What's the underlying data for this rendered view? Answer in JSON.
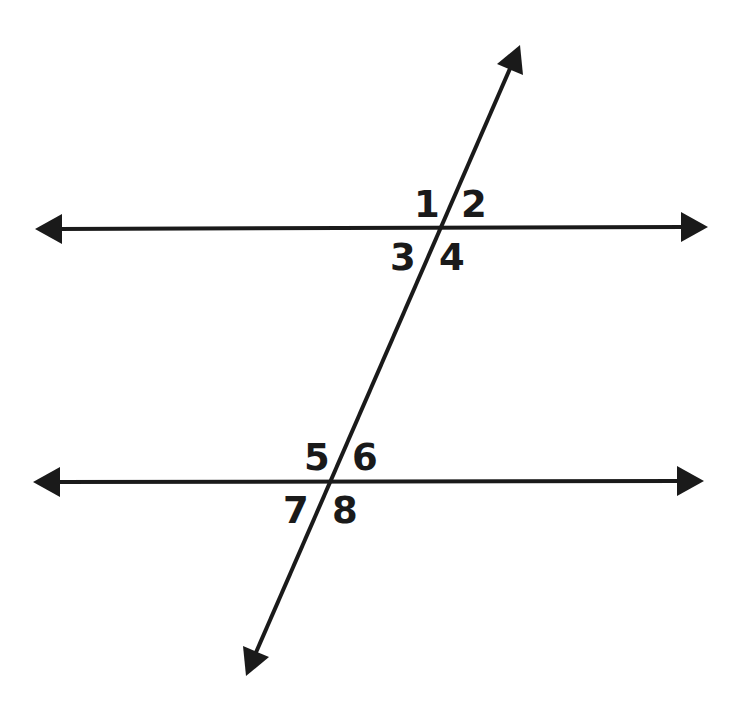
{
  "diagram": {
    "colors": {
      "background": "#ffffff",
      "stroke": "#1a1a1a"
    },
    "lines": {
      "upper_parallel": {
        "x1": 35,
        "y1": 229,
        "x2": 708,
        "y2": 227
      },
      "lower_parallel": {
        "x1": 33,
        "y1": 482,
        "x2": 704,
        "y2": 481
      },
      "transversal": {
        "x1": 520,
        "y1": 45,
        "x2": 246,
        "y2": 676
      }
    },
    "intersections": {
      "upper": {
        "x": 438,
        "y": 228
      },
      "lower": {
        "x": 329,
        "y": 482
      }
    },
    "angle_labels": [
      {
        "id": "1",
        "text": "1",
        "x": 414,
        "y": 217
      },
      {
        "id": "2",
        "text": "2",
        "x": 461,
        "y": 217
      },
      {
        "id": "3",
        "text": "3",
        "x": 390,
        "y": 270
      },
      {
        "id": "4",
        "text": "4",
        "x": 439,
        "y": 270
      },
      {
        "id": "5",
        "text": "5",
        "x": 304,
        "y": 470
      },
      {
        "id": "6",
        "text": "6",
        "x": 352,
        "y": 470
      },
      {
        "id": "7",
        "text": "7",
        "x": 283,
        "y": 523
      },
      {
        "id": "8",
        "text": "8",
        "x": 332,
        "y": 523
      }
    ]
  }
}
